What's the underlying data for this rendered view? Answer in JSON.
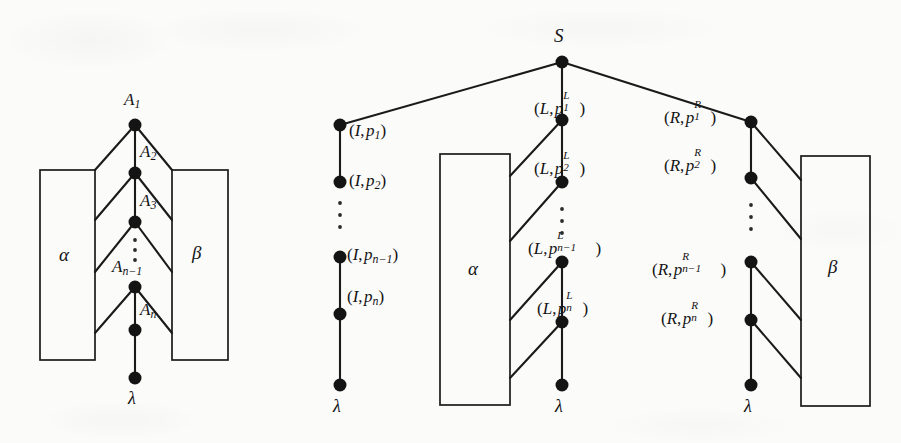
{
  "figure": {
    "background_color": "#fbfbfa",
    "ink_color": "#141414",
    "width": 901,
    "height": 443
  },
  "left_diagram": {
    "name": "left-tree",
    "spine_labels": [
      "A",
      "A",
      "A",
      "A",
      "A"
    ],
    "nodes": [
      {
        "id": "A1",
        "base": "A",
        "sub": "1",
        "x": 135,
        "y": 125,
        "label_x": 124,
        "label_y": 91
      },
      {
        "id": "A2",
        "base": "A",
        "sub": "2",
        "x": 135,
        "y": 173,
        "label_x": 140,
        "label_y": 143
      },
      {
        "id": "A3",
        "base": "A",
        "sub": "3",
        "x": 135,
        "y": 222,
        "label_x": 140,
        "label_y": 192
      },
      {
        "id": "An-1",
        "base": "A",
        "sub": "n−1",
        "x": 135,
        "y": 287,
        "label_x": 112,
        "label_y": 258
      },
      {
        "id": "An",
        "base": "A",
        "sub": "n",
        "x": 135,
        "y": 330,
        "label_x": 140,
        "label_y": 301
      },
      {
        "id": "leaf",
        "base": "λ",
        "sub": "",
        "x": 135,
        "y": 378,
        "label_x": 128,
        "label_y": 389
      }
    ],
    "boxes": [
      {
        "id": "alpha-left",
        "label": "α",
        "x": 40,
        "y": 170,
        "w": 55,
        "h": 190,
        "label_x": 59,
        "label_y": 254
      },
      {
        "id": "beta-left",
        "label": "β",
        "x": 172,
        "y": 170,
        "w": 56,
        "h": 190,
        "label_x": 192,
        "label_y": 254
      }
    ],
    "ellipsis": {
      "x": 135,
      "y_start": 238,
      "y_end": 262,
      "count": 3
    },
    "leaf_label": "λ"
  },
  "right_diagram": {
    "name": "right-tree",
    "root": {
      "id": "S",
      "label": "S",
      "x": 562,
      "y": 62,
      "label_x": 554,
      "label_y": 26
    },
    "chains": [
      {
        "id": "I-chain",
        "x": 340,
        "prefix": "I",
        "symbol_kind": "plain",
        "nodes": [
          {
            "id": "I1",
            "y": 125,
            "text": "(I, p1)",
            "sub": "1",
            "sup": "",
            "label_x": 349,
            "label_y": 123
          },
          {
            "id": "I2",
            "y": 182,
            "text": "(I, p2)",
            "sub": "2",
            "sup": "",
            "label_x": 349,
            "label_y": 172
          },
          {
            "id": "In-1",
            "y": 257,
            "text": "(I, pn-1)",
            "sub": "n−1",
            "sup": "",
            "label_x": 347,
            "label_y": 247
          },
          {
            "id": "In",
            "y": 314,
            "text": "(I, pn)",
            "sub": "n",
            "sup": "",
            "label_x": 347,
            "label_y": 289
          },
          {
            "id": "Ileaf",
            "y": 385,
            "text": "λ",
            "sub": "",
            "sup": "",
            "label_x": 333,
            "label_y": 398
          }
        ],
        "ellipsis": {
          "x": 340,
          "y_start": 200,
          "y_end": 228,
          "count": 3
        },
        "leaf_label": "λ"
      },
      {
        "id": "L-chain",
        "x": 562,
        "prefix": "L",
        "symbol_kind": "supsub",
        "nodes": [
          {
            "id": "L1",
            "y": 120,
            "text": "(L, p1^L)",
            "sub": "1",
            "sup": "L",
            "label_x": 533,
            "label_y": 97
          },
          {
            "id": "L2",
            "y": 182,
            "text": "(L, p2^L)",
            "sub": "2",
            "sup": "L",
            "label_x": 533,
            "label_y": 158
          },
          {
            "id": "Ln-1",
            "y": 262,
            "text": "(L, pn-1^L)",
            "sub": "n−1",
            "sup": "L",
            "label_x": 528,
            "label_y": 238
          },
          {
            "id": "Ln",
            "y": 322,
            "text": "(L, pn^L)",
            "sub": "n",
            "sup": "L",
            "label_x": 536,
            "label_y": 298
          },
          {
            "id": "Lleaf",
            "y": 385,
            "text": "λ",
            "sub": "",
            "sup": "",
            "label_x": 555,
            "label_y": 398
          }
        ],
        "ellipsis": {
          "x": 562,
          "y_start": 206,
          "y_end": 232,
          "count": 3
        },
        "leaf_label": "λ"
      },
      {
        "id": "R-chain",
        "x": 751,
        "prefix": "R",
        "symbol_kind": "supsub",
        "nodes": [
          {
            "id": "R1",
            "y": 122,
            "text": "(R, p1^R)",
            "sub": "1",
            "sup": "R",
            "label_x": 663,
            "label_y": 106
          },
          {
            "id": "R2",
            "y": 178,
            "text": "(R, p2^R)",
            "sub": "2",
            "sup": "R",
            "label_x": 663,
            "label_y": 154
          },
          {
            "id": "Rn-1",
            "y": 262,
            "text": "(R, pn-1^R)",
            "sub": "n−1",
            "sup": "R",
            "label_x": 652,
            "label_y": 258
          },
          {
            "id": "Rn",
            "y": 320,
            "text": "(R, pn^R)",
            "sub": "n",
            "sup": "R",
            "label_x": 660,
            "label_y": 307
          },
          {
            "id": "Rleaf",
            "y": 385,
            "text": "λ",
            "sub": "",
            "sup": "",
            "label_x": 744,
            "label_y": 398
          }
        ],
        "ellipsis": {
          "x": 751,
          "y_start": 202,
          "y_end": 230,
          "count": 3
        },
        "leaf_label": "λ"
      }
    ],
    "boxes": [
      {
        "id": "alpha-right",
        "label": "α",
        "x": 440,
        "y": 154,
        "w": 70,
        "h": 251,
        "label_x": 468,
        "label_y": 268
      },
      {
        "id": "beta-right",
        "label": "β",
        "x": 801,
        "y": 156,
        "w": 69,
        "h": 250,
        "label_x": 828,
        "label_y": 268
      }
    ]
  },
  "symbols": {
    "lambda": "λ",
    "alpha": "α",
    "beta": "β",
    "minus": "−",
    "open_paren": "(",
    "close_paren": ")",
    "comma": ","
  }
}
